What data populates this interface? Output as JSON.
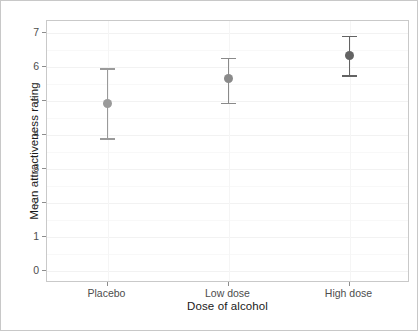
{
  "chart_data": {
    "type": "scatter",
    "title": "",
    "xlabel": "Dose of alcohol",
    "ylabel": "Mean attractiveness rating",
    "categories": [
      "Placebo",
      "Low dose",
      "High dose"
    ],
    "values": [
      4.93,
      5.67,
      6.33
    ],
    "error_low": [
      3.9,
      4.95,
      5.75
    ],
    "error_high": [
      5.97,
      6.27,
      6.92
    ],
    "series": [
      {
        "name": "Mean attractiveness rating",
        "points": [
          {
            "category": "Placebo",
            "mean": 4.93,
            "ci_lower": 3.9,
            "ci_upper": 5.97,
            "color": "#9a9a9a"
          },
          {
            "category": "Low dose",
            "mean": 5.67,
            "ci_lower": 4.95,
            "ci_upper": 6.27,
            "color": "#8a8a8a"
          },
          {
            "category": "High dose",
            "mean": 6.33,
            "ci_lower": 5.75,
            "ci_upper": 6.92,
            "color": "#636363"
          }
        ]
      }
    ],
    "ylim": [
      -0.35,
      7.35
    ],
    "yticks": [
      0,
      1,
      2,
      3,
      4,
      5,
      6,
      7
    ],
    "ytick_labels": [
      "0",
      "1",
      "2",
      "3",
      "4",
      "5",
      "6",
      "7"
    ],
    "xlim": [
      0.5,
      3.5
    ],
    "grid": true,
    "legend": null,
    "legend_position": "none",
    "error_bar_type": "95% confidence interval",
    "marker": "filled-circle",
    "panel_background": "#ffffff",
    "panel_border_color": "#c9c9c9",
    "gridline_color": "#f2f2f2",
    "axis_text_color": "#4d4d4d",
    "title_text_color": "#1a1a1a"
  },
  "axes": {
    "y_title": "Mean attractiveness rating",
    "x_title": "Dose of alcohol",
    "y_ticks": [
      {
        "label": "7",
        "value": 7
      },
      {
        "label": "6",
        "value": 6
      },
      {
        "label": "5",
        "value": 5
      },
      {
        "label": "4",
        "value": 4
      },
      {
        "label": "3",
        "value": 3
      },
      {
        "label": "2",
        "value": 2
      },
      {
        "label": "1",
        "value": 1
      },
      {
        "label": "0",
        "value": 0
      }
    ],
    "x_ticks": [
      {
        "label": "Placebo"
      },
      {
        "label": "Low dose"
      },
      {
        "label": "High dose"
      }
    ]
  }
}
